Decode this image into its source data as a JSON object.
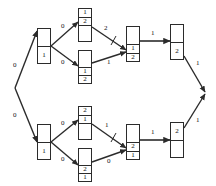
{
  "diagram": {
    "type": "directed-graph",
    "stroke_color": "#2b2b2b",
    "label_color": "#111111",
    "background_color": "#ffffff",
    "source_vertex": {
      "label": ""
    },
    "sink_vertex": {
      "label": ""
    },
    "nodes": [
      {
        "id": "n-top-start",
        "upper": "",
        "lower_top": "1",
        "lower_bottom": ""
      },
      {
        "id": "n-top-upper",
        "upper": "1",
        "lower_top": "2",
        "lower_bottom": ""
      },
      {
        "id": "n-top-lower",
        "upper": "",
        "lower_top": "1",
        "lower_bottom": "2"
      },
      {
        "id": "n-top-merge",
        "upper": "",
        "lower_top": "1",
        "lower_bottom": "2"
      },
      {
        "id": "n-top-end",
        "upper": "",
        "lower_top": "2",
        "lower_bottom": ""
      },
      {
        "id": "n-bot-start",
        "upper": "",
        "lower_top": "1",
        "lower_bottom": ""
      },
      {
        "id": "n-bot-upper",
        "upper": "2",
        "lower_top": "1",
        "lower_bottom": ""
      },
      {
        "id": "n-bot-lower",
        "upper": "",
        "lower_top": "2",
        "lower_bottom": "1"
      },
      {
        "id": "n-bot-merge",
        "upper": "",
        "lower_top": "2",
        "lower_bottom": "1"
      },
      {
        "id": "n-bot-end",
        "upper": "2",
        "lower_top": "",
        "lower_bottom": ""
      }
    ],
    "edge_labels": {
      "source_to_top": "0",
      "source_to_bottom": "0",
      "top_start_to_upper": "0",
      "top_start_to_lower": "0",
      "top_upper_to_merge": "2",
      "top_lower_to_merge": "1",
      "top_merge_to_end": "1",
      "top_end_to_sink": "1",
      "bot_start_to_upper": "0",
      "bot_start_to_lower": "0",
      "bot_upper_to_merge": "1",
      "bot_lower_to_merge": "0",
      "bot_merge_to_end": "1",
      "bot_end_to_sink": "1"
    }
  }
}
